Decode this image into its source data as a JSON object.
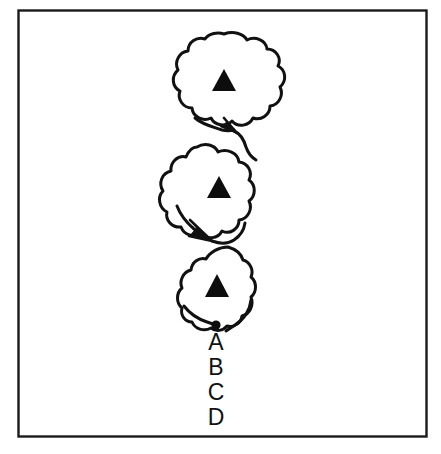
{
  "figure": {
    "title": "",
    "background_color": "#ffffff",
    "border": {
      "name": "figure-frame",
      "color": "#1a1a1a",
      "x": 18,
      "y": 10,
      "width": 409,
      "height": 427,
      "stroke_width": 2.5
    },
    "stroke_color": "#111111",
    "fill_color": "#ffffff",
    "blobs": [
      {
        "id": "blob-1",
        "label": "",
        "center_x": 224,
        "center_y": 82,
        "radius_x": 49,
        "radius_y": 48,
        "marker": "triangle",
        "marker_color": "#0d0d0d"
      },
      {
        "id": "blob-2",
        "label": "",
        "center_x": 219,
        "center_y": 190,
        "radius_x": 40,
        "radius_y": 50,
        "marker": "triangle",
        "marker_color": "#0d0d0d"
      },
      {
        "id": "blob-3",
        "label": "",
        "center_x": 217,
        "center_y": 289,
        "radius_x": 36,
        "radius_y": 46,
        "marker": "triangle",
        "marker_color": "#0d0d0d"
      }
    ],
    "arrows": [
      {
        "id": "arrow-1",
        "from": "blob-1",
        "to": "blob-2",
        "tip_x": 232,
        "tip_y": 130,
        "direction": "down-right"
      },
      {
        "id": "arrow-2",
        "from": "blob-2",
        "to": "blob-3",
        "tip_x": 207,
        "tip_y": 238,
        "direction": "down-right"
      }
    ],
    "endpoint_dot": {
      "id": "endpoint-dot",
      "x": 216,
      "y": 325,
      "radius": 4.5,
      "color": "#0d0d0d"
    },
    "labels": [
      {
        "id": "label-a",
        "text": "A",
        "x": 216,
        "y": 348
      },
      {
        "id": "label-b",
        "text": "B",
        "x": 216,
        "y": 373
      },
      {
        "id": "label-c",
        "text": "C",
        "x": 216,
        "y": 398
      },
      {
        "id": "label-d",
        "text": "D",
        "x": 216,
        "y": 423
      }
    ]
  }
}
